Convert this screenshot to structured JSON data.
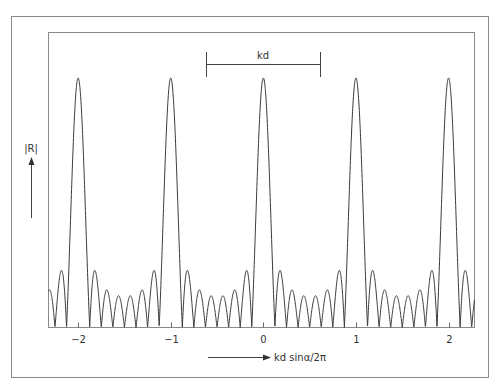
{
  "figure": {
    "y_axis_label": "|R|",
    "x_axis_label": "kd sinα/2π",
    "period_annotation": "kd"
  },
  "chart_data": {
    "type": "line",
    "title": "",
    "xlabel": "kd sinα/2π",
    "ylabel": "|R|",
    "xlim": [
      -2.32,
      2.28
    ],
    "ylim": [
      0,
      1.08
    ],
    "grid": false,
    "legend": null,
    "xticks": [
      -2,
      -1,
      0,
      1,
      2
    ],
    "xtick_labels": [
      "−2",
      "−1",
      "0",
      "1",
      "2"
    ],
    "function": "|sin(Nπu)/(N sin(πu))|",
    "N": 8,
    "principal_maxima": [
      {
        "x": -2,
        "y": 1.0
      },
      {
        "x": -1,
        "y": 1.0
      },
      {
        "x": 0,
        "y": 1.0
      },
      {
        "x": 1,
        "y": 1.0
      },
      {
        "x": 2,
        "y": 1.0
      }
    ],
    "side_lobes_between_maxima": 6,
    "zeros_between_maxima": 7,
    "side_lobe_peaks_relative": [
      0.22,
      0.14,
      0.13,
      0.13,
      0.14,
      0.22
    ],
    "annotations": [
      {
        "text": "kd",
        "type": "bracket",
        "x_start": -0.62,
        "x_end": 0.62,
        "meaning": "period"
      }
    ]
  }
}
